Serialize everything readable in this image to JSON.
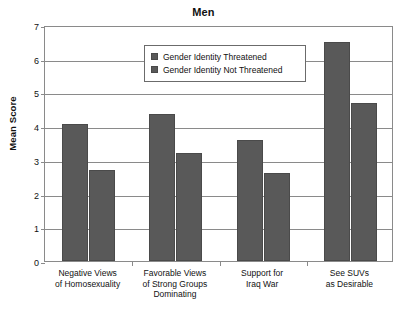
{
  "chart_data": {
    "type": "bar",
    "title": "Men",
    "xlabel": "",
    "ylabel": "Mean Score",
    "ylim": [
      0,
      7
    ],
    "yticks": [
      0,
      1,
      2,
      3,
      4,
      5,
      6,
      7
    ],
    "ytick_labels": [
      "0",
      "1",
      "2",
      "3",
      "4",
      "5",
      "6",
      "7"
    ],
    "grid": true,
    "legend_position": "upper center",
    "categories": [
      "Negative Views of Homosexuality",
      "Favorable Views of Strong Groups Dominating",
      "Support for Iraq War",
      "See SUVs as Desirable"
    ],
    "category_lines": [
      [
        "Negative Views",
        "of Homosexuality"
      ],
      [
        "Favorable Views",
        "of Strong Groups",
        "Dominating"
      ],
      [
        "Support for",
        "Iraq War"
      ],
      [
        "See SUVs",
        "as Desirable"
      ]
    ],
    "series": [
      {
        "name": "Gender Identity Threatened",
        "color": "#595959",
        "values": [
          4.05,
          4.35,
          3.6,
          6.5
        ]
      },
      {
        "name": "Gender Identity Not Threatened",
        "color": "#595959",
        "values": [
          2.7,
          3.2,
          2.6,
          4.7
        ]
      }
    ]
  },
  "legend": {
    "items": [
      {
        "label": "Gender Identity Threatened"
      },
      {
        "label": "Gender Identity Not Threatened"
      }
    ]
  },
  "colors": {
    "bar_fill": "#595959",
    "bar_edge": "#4a4a4a",
    "axis": "#8a8a8a",
    "text": "#111111",
    "background": "#ffffff"
  }
}
